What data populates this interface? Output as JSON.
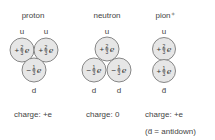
{
  "particles": [
    {
      "name": "proton",
      "top_labels": [
        "u",
        "u"
      ],
      "bottom_labels": [
        "d"
      ],
      "quarks": [
        {
          "flavor": "u",
          "charge_sign": "+",
          "num": "2",
          "den": "3"
        },
        {
          "flavor": "u",
          "charge_sign": "+",
          "num": "2",
          "den": "3"
        },
        {
          "flavor": "d",
          "charge_sign": "−",
          "num": "1",
          "den": "3"
        }
      ],
      "charge": "charge: +e"
    },
    {
      "name": "neutron",
      "top_labels": [
        "u"
      ],
      "bottom_labels": [
        "d",
        "d"
      ],
      "quarks": [
        {
          "flavor": "u",
          "charge_sign": "+",
          "num": "2",
          "den": "3"
        },
        {
          "flavor": "d",
          "charge_sign": "−",
          "num": "1",
          "den": "3"
        },
        {
          "flavor": "d",
          "charge_sign": "−",
          "num": "1",
          "den": "3"
        }
      ],
      "charge": "charge: 0"
    },
    {
      "name": "pion⁺",
      "top_labels": [
        "u"
      ],
      "bottom_labels": [
        "d̄"
      ],
      "quarks": [
        {
          "flavor": "u",
          "charge_sign": "+",
          "num": "2",
          "den": "3"
        },
        {
          "flavor": "d̄",
          "charge_sign": "+",
          "num": "1",
          "den": "3"
        }
      ],
      "charge": "charge: +e"
    }
  ],
  "unit_symbol": "e",
  "footnote": "(d̄ = antidown)",
  "colors": {
    "circle_fill": "#e6e6e6",
    "circle_stroke": "#7a7a7a",
    "text": "#444444"
  }
}
